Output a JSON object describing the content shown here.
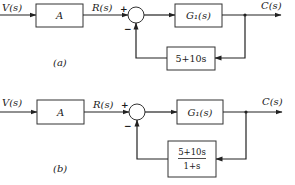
{
  "diagrams": [
    {
      "caption": "(a)",
      "input_label": "V(s)",
      "block_a": "A",
      "reference_label": "R(s)",
      "sum_plus": "+",
      "sum_minus": "−",
      "forward_block": "G₁(s)",
      "output_label": "C(s)",
      "feedback_block": "5+10s"
    },
    {
      "caption": "(b)",
      "input_label": "V(s)",
      "block_a": "A",
      "reference_label": "R(s)",
      "sum_plus": "+",
      "sum_minus": "−",
      "forward_block": "G₁(s)",
      "output_label": "C(s)",
      "feedback_numerator": "5+10s",
      "feedback_denominator": "1+s"
    }
  ]
}
